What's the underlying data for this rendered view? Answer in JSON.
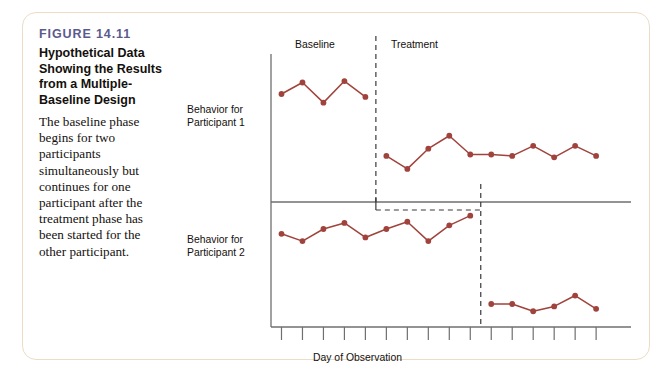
{
  "figure": {
    "number": "FIGURE 14.11",
    "title": "Hypothetical Data Showing the Results from a Multiple-Baseline Design",
    "description": "The baseline phase begins for two participants simultaneously but continues for one participant after the treatment phase has been started for the other participant."
  },
  "colors": {
    "accent": "#a0433c",
    "figure_number": "#5b5a8e",
    "axis": "#6f6f6f",
    "card_border": "#ecdcc8",
    "text": "#14100d",
    "background": "#ffffff"
  },
  "chart_data": {
    "type": "line",
    "title": "Hypothetical Data Showing the Results from a Multiple-Baseline Design",
    "xlabel": "Day of Observation",
    "grid": false,
    "legend": null,
    "x_ticks": 16,
    "x_tick_labels": [],
    "phases": [
      {
        "label": "Baseline",
        "name": "baseline-phase-label"
      },
      {
        "label": "Treatment",
        "name": "treatment-phase-label"
      }
    ],
    "panels": [
      {
        "name": "participant-1-panel",
        "ylabel": "Behavior for Participant 1",
        "ylim": [
          0,
          10
        ],
        "phase_change_day": 5,
        "series": [
          {
            "name": "Baseline",
            "x": [
              1,
              2,
              3,
              4,
              5
            ],
            "values": [
              7.5,
              8.3,
              6.9,
              8.4,
              7.3
            ]
          },
          {
            "name": "Treatment",
            "x": [
              6,
              7,
              8,
              9,
              10,
              11,
              12,
              13,
              14,
              15,
              16
            ],
            "values": [
              3.2,
              2.3,
              3.7,
              4.6,
              3.3,
              3.3,
              3.2,
              3.9,
              3.1,
              3.9,
              3.2
            ]
          }
        ]
      },
      {
        "name": "participant-2-panel",
        "ylabel": "Behavior for Participant 2",
        "ylim": [
          0,
          10
        ],
        "phase_change_day": 10,
        "series": [
          {
            "name": "Baseline",
            "x": [
              1,
              2,
              3,
              4,
              5,
              6,
              7,
              8,
              9,
              10
            ],
            "values": [
              7.7,
              7.1,
              8.1,
              8.6,
              7.4,
              8.1,
              8.7,
              7.1,
              8.4,
              9.2
            ]
          },
          {
            "name": "Treatment",
            "x": [
              11,
              12,
              13,
              14,
              15,
              16
            ],
            "values": [
              1.9,
              1.9,
              1.3,
              1.7,
              2.6,
              1.5
            ]
          }
        ]
      }
    ]
  }
}
